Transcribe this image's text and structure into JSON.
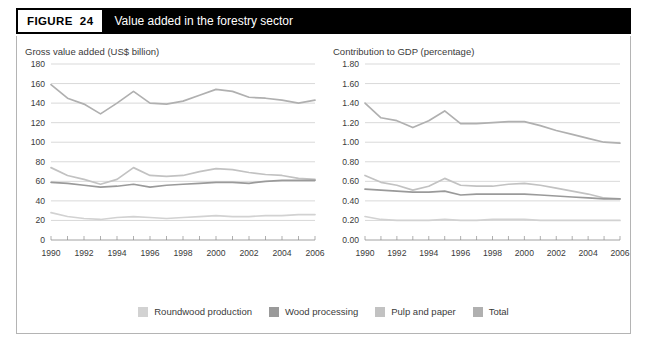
{
  "header": {
    "tag_label": "FIGURE",
    "tag_number": "24",
    "title": "Value added in the forestry sector"
  },
  "legend": {
    "position": "bottom-center",
    "items": [
      {
        "label": "Roundwood production",
        "color": "#d2d2d2"
      },
      {
        "label": "Wood processing",
        "color": "#9a9a9a"
      },
      {
        "label": "Pulp and paper",
        "color": "#c2c2c2"
      },
      {
        "label": "Total",
        "color": "#b0b0b0"
      }
    ]
  },
  "chart_data": [
    {
      "type": "line",
      "id": "gross-value-added",
      "title": "Gross value added (US$ billion)",
      "xlabel": "",
      "ylabel": "Gross value added (US$ billion)",
      "x": [
        1990,
        1991,
        1992,
        1993,
        1994,
        1995,
        1996,
        1997,
        1998,
        1999,
        2000,
        2001,
        2002,
        2003,
        2004,
        2005,
        2006
      ],
      "xlim": [
        1990,
        2006
      ],
      "ylim": [
        0,
        180
      ],
      "yticks": [
        0,
        20,
        40,
        60,
        80,
        100,
        120,
        140,
        160,
        180
      ],
      "ytick_labels": [
        "0",
        "20",
        "40",
        "60",
        "80",
        "100",
        "120",
        "140",
        "160",
        "180"
      ],
      "xticks": [
        1990,
        1991,
        1992,
        1993,
        1994,
        1995,
        1996,
        1997,
        1998,
        1999,
        2000,
        2001,
        2002,
        2003,
        2004,
        2005,
        2006
      ],
      "xtick_labels": [
        "1990",
        "",
        "1992",
        "",
        "1994",
        "",
        "1996",
        "",
        "1998",
        "",
        "2000",
        "",
        "2002",
        "",
        "2004",
        "",
        "2006"
      ],
      "grid": true,
      "series": [
        {
          "name": "Total",
          "color": "#b0b0b0",
          "values": [
            159,
            145,
            139,
            129,
            140,
            152,
            140,
            139,
            142,
            148,
            154,
            152,
            146,
            145,
            143,
            140,
            143
          ]
        },
        {
          "name": "Pulp and paper",
          "color": "#c2c2c2",
          "values": [
            74,
            66,
            62,
            57,
            62,
            74,
            66,
            65,
            66,
            70,
            73,
            72,
            69,
            67,
            66,
            63,
            62
          ]
        },
        {
          "name": "Wood processing",
          "color": "#9a9a9a",
          "values": [
            59,
            58,
            56,
            54,
            55,
            57,
            54,
            56,
            57,
            58,
            59,
            59,
            58,
            60,
            61,
            61,
            61
          ]
        },
        {
          "name": "Roundwood production",
          "color": "#d2d2d2",
          "values": [
            28,
            24,
            22,
            21,
            23,
            24,
            23,
            22,
            23,
            24,
            25,
            24,
            24,
            25,
            25,
            26,
            26
          ]
        }
      ]
    },
    {
      "type": "line",
      "id": "contribution-to-gdp",
      "title": "Contribution to GDP (percentage)",
      "xlabel": "",
      "ylabel": "Contribution to GDP (percentage)",
      "x": [
        1990,
        1991,
        1992,
        1993,
        1994,
        1995,
        1996,
        1997,
        1998,
        1999,
        2000,
        2001,
        2002,
        2003,
        2004,
        2005,
        2006
      ],
      "xlim": [
        1990,
        2006
      ],
      "ylim": [
        0.0,
        1.8
      ],
      "yticks": [
        0.0,
        0.2,
        0.4,
        0.6,
        0.8,
        1.0,
        1.2,
        1.4,
        1.6,
        1.8
      ],
      "ytick_labels": [
        "0.00",
        "0.20",
        "0.40",
        "0.60",
        "0.80",
        "1.00",
        "1.20",
        "1.40",
        "1.60",
        "1.80"
      ],
      "xticks": [
        1990,
        1991,
        1992,
        1993,
        1994,
        1995,
        1996,
        1997,
        1998,
        1999,
        2000,
        2001,
        2002,
        2003,
        2004,
        2005,
        2006
      ],
      "xtick_labels": [
        "1990",
        "",
        "1992",
        "",
        "1994",
        "",
        "1996",
        "",
        "1998",
        "",
        "2000",
        "",
        "2002",
        "",
        "2004",
        "",
        "2006"
      ],
      "grid": true,
      "series": [
        {
          "name": "Total",
          "color": "#b0b0b0",
          "values": [
            1.4,
            1.25,
            1.22,
            1.15,
            1.22,
            1.32,
            1.19,
            1.19,
            1.2,
            1.21,
            1.21,
            1.17,
            1.12,
            1.08,
            1.04,
            1.0,
            0.99
          ]
        },
        {
          "name": "Pulp and paper",
          "color": "#c2c2c2",
          "values": [
            0.66,
            0.59,
            0.56,
            0.51,
            0.55,
            0.63,
            0.56,
            0.55,
            0.55,
            0.57,
            0.58,
            0.56,
            0.53,
            0.5,
            0.47,
            0.43,
            0.42
          ]
        },
        {
          "name": "Wood processing",
          "color": "#9a9a9a",
          "values": [
            0.52,
            0.51,
            0.5,
            0.49,
            0.49,
            0.5,
            0.46,
            0.47,
            0.47,
            0.47,
            0.47,
            0.46,
            0.45,
            0.44,
            0.43,
            0.42,
            0.42
          ]
        },
        {
          "name": "Roundwood production",
          "color": "#d2d2d2",
          "values": [
            0.24,
            0.21,
            0.2,
            0.2,
            0.2,
            0.21,
            0.2,
            0.2,
            0.21,
            0.21,
            0.21,
            0.2,
            0.2,
            0.2,
            0.2,
            0.2,
            0.2
          ]
        }
      ]
    }
  ]
}
